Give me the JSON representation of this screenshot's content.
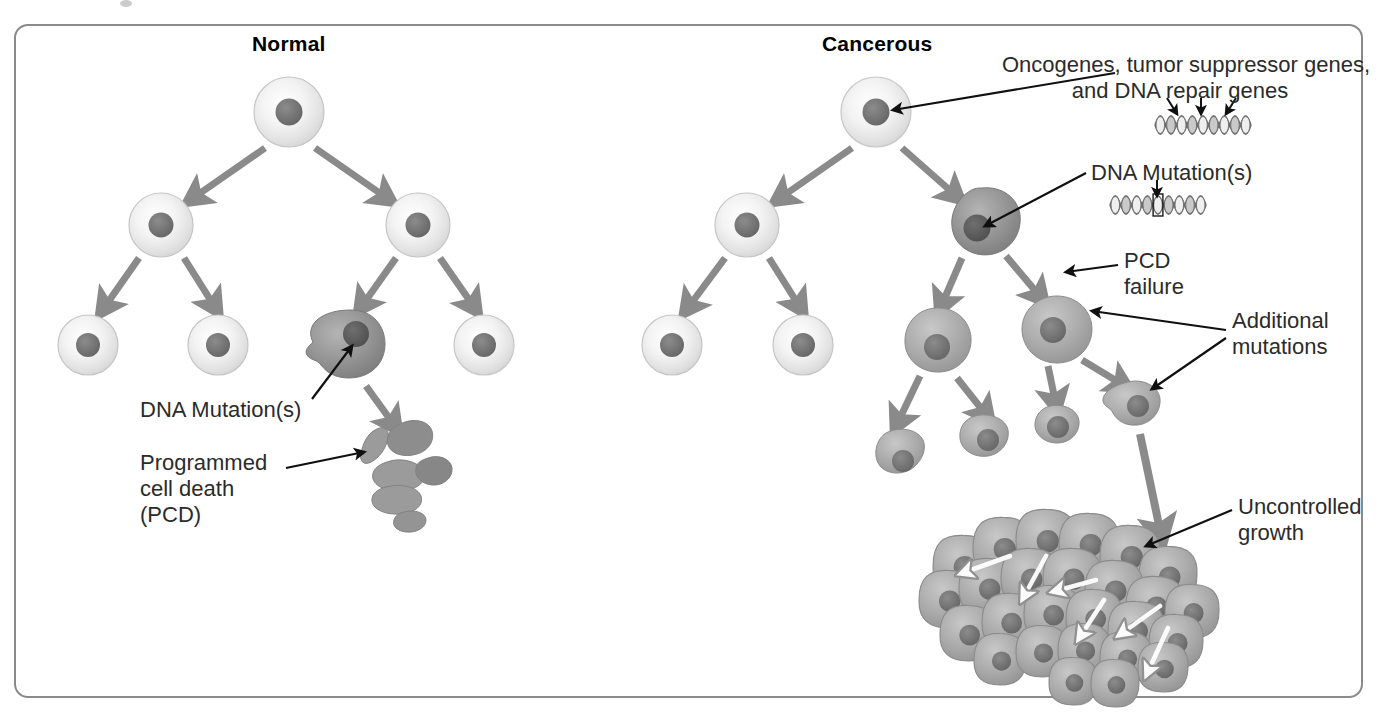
{
  "figure": {
    "domain": "biology-diagram",
    "title_normal": "Normal",
    "title_cancerous": "Cancerous",
    "frame_color": "#8a8a8a",
    "background": "#ffffff"
  },
  "columns": [
    {
      "id": "normal",
      "label": "Normal",
      "x": 252,
      "y": 32
    },
    {
      "id": "cancerous",
      "label": "Cancerous",
      "x": 822,
      "y": 32
    }
  ],
  "labels": [
    {
      "id": "oncogenes",
      "text": "Oncogenes, tumor suppressor genes,\nand DNA repair genes",
      "align": "center",
      "x": 1180,
      "y": 52,
      "points_to": "cancerous-root-nucleus"
    },
    {
      "id": "dna-mutations-right",
      "text": "DNA Mutation(s)",
      "align": "left",
      "x": 1091,
      "y": 160,
      "points_to": "cancerous-mutated-cell-nucleus"
    },
    {
      "id": "pcd-failure",
      "text": "PCD\nfailure",
      "align": "left",
      "x": 1124,
      "y": 248,
      "points_to": "pcd-failure-target"
    },
    {
      "id": "additional-mutations",
      "text": "Additional\nmutations",
      "align": "left",
      "x": 1232,
      "y": 308,
      "points_to": "two-cancer-cells"
    },
    {
      "id": "uncontrolled-growth",
      "text": "Uncontrolled\ngrowth",
      "align": "left",
      "x": 1238,
      "y": 494,
      "points_to": "tumor-mass"
    },
    {
      "id": "dna-mutations-left",
      "text": "DNA Mutation(s)",
      "align": "left",
      "x": 140,
      "y": 397,
      "points_to": "normal-mutated-cell-nucleus"
    },
    {
      "id": "programmed-cell-death",
      "text": "Programmed\ncell death\n(PCD)",
      "align": "left",
      "x": 140,
      "y": 450,
      "points_to": "apoptotic-fragments"
    }
  ],
  "dna_strands": [
    {
      "id": "dna-normal-genes",
      "x": 1155,
      "y": 125,
      "width": 96,
      "marked_index": 4,
      "tick_marks": 3,
      "caption_ref": "oncogenes"
    },
    {
      "id": "dna-mutated",
      "x": 1110,
      "y": 205,
      "width": 96,
      "marked_index": 4,
      "tick_marks": 1,
      "boxed": true,
      "caption_ref": "dna-mutations-right"
    }
  ],
  "chart_data": {
    "type": "diagram",
    "panels": [
      {
        "name": "Normal",
        "generations": 3,
        "cells": [
          {
            "gen": 0,
            "x": 289,
            "y": 112,
            "r": 35,
            "kind": "normal"
          },
          {
            "gen": 1,
            "x": 161,
            "y": 225,
            "r": 32,
            "kind": "normal"
          },
          {
            "gen": 1,
            "x": 418,
            "y": 225,
            "r": 32,
            "kind": "normal"
          },
          {
            "gen": 2,
            "x": 88,
            "y": 345,
            "r": 30,
            "kind": "normal"
          },
          {
            "gen": 2,
            "x": 218,
            "y": 345,
            "r": 30,
            "kind": "normal"
          },
          {
            "gen": 2,
            "x": 351,
            "y": 343,
            "r": 33,
            "kind": "mutated"
          },
          {
            "gen": 2,
            "x": 484,
            "y": 345,
            "r": 30,
            "kind": "normal"
          }
        ],
        "outcome": "apoptosis",
        "apoptotic_fragment_count": 7
      },
      {
        "name": "Cancerous",
        "generations": 4,
        "cells": [
          {
            "gen": 0,
            "x": 876,
            "y": 112,
            "r": 35,
            "kind": "normal"
          },
          {
            "gen": 1,
            "x": 747,
            "y": 225,
            "r": 32,
            "kind": "normal"
          },
          {
            "gen": 1,
            "x": 982,
            "y": 222,
            "r": 34,
            "kind": "mutated"
          },
          {
            "gen": 2,
            "x": 672,
            "y": 345,
            "r": 30,
            "kind": "normal"
          },
          {
            "gen": 2,
            "x": 803,
            "y": 345,
            "r": 30,
            "kind": "normal"
          },
          {
            "gen": 2,
            "x": 936,
            "y": 340,
            "r": 32,
            "kind": "cancer"
          },
          {
            "gen": 2,
            "x": 1057,
            "y": 330,
            "r": 33,
            "kind": "cancer"
          },
          {
            "gen": 3,
            "x": 905,
            "y": 452,
            "r": 23,
            "kind": "cancer"
          },
          {
            "gen": 3,
            "x": 991,
            "y": 437,
            "r": 23,
            "kind": "cancer"
          },
          {
            "gen": 3,
            "x": 1063,
            "y": 426,
            "r": 22,
            "kind": "cancer"
          },
          {
            "gen": 3,
            "x": 1136,
            "y": 406,
            "r": 24,
            "kind": "cancer"
          }
        ],
        "outcome": "uncontrolled-growth",
        "tumor_cell_count": 26
      }
    ],
    "legend": [
      {
        "kind": "normal",
        "fill": "#ececec",
        "nucleus": "#7b7b7b",
        "desc": "normal cell"
      },
      {
        "kind": "mutated",
        "fill": "#8e8e8e",
        "nucleus": "#5f5f5f",
        "desc": "cell with DNA mutation"
      },
      {
        "kind": "cancer",
        "fill": "#a9a9a9",
        "nucleus": "#6d6d6d",
        "desc": "cancerous cell"
      }
    ],
    "arrow_color": "#8a8a8a",
    "pointer_color": "#101010"
  }
}
